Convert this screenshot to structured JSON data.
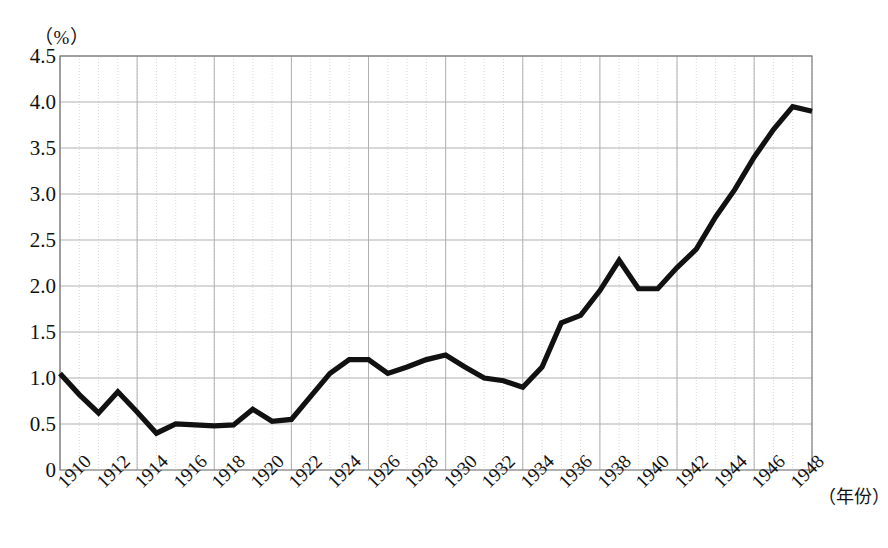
{
  "figure": {
    "y_axis_unit": "（%）",
    "x_axis_title": "（年份）",
    "caption": "",
    "line_color": "#111111",
    "grid_minor_color": "#d8d8d8",
    "grid_major_color": "#b0b0b0",
    "axis_color": "#7a7a7a"
  },
  "chart_data": {
    "type": "line",
    "title": "",
    "subtitle": "",
    "xlabel": "（年份）",
    "ylabel": "（%）",
    "xlim": [
      1910,
      1949
    ],
    "ylim": [
      0,
      4.5
    ],
    "grid": true,
    "legend": "none",
    "y_ticks": [
      "4.5",
      "4.0",
      "3.5",
      "3.0",
      "2.5",
      "2.0",
      "1.5",
      "1.0",
      "0.5",
      "0"
    ],
    "y_tick_values": [
      4.5,
      4.0,
      3.5,
      3.0,
      2.5,
      2.0,
      1.5,
      1.0,
      0.5,
      0
    ],
    "x_ticks": [
      "1910",
      "1912",
      "1914",
      "1916",
      "1918",
      "1920",
      "1922",
      "1924",
      "1926",
      "1928",
      "1930",
      "1932",
      "1934",
      "1936",
      "1938",
      "1940",
      "1942",
      "1944",
      "1946",
      "1948"
    ],
    "x_tick_values": [
      1910,
      1912,
      1914,
      1916,
      1918,
      1920,
      1922,
      1924,
      1926,
      1928,
      1930,
      1932,
      1934,
      1936,
      1938,
      1940,
      1942,
      1944,
      1946,
      1948
    ],
    "x": [
      1910,
      1911,
      1912,
      1913,
      1914,
      1915,
      1916,
      1917,
      1918,
      1919,
      1920,
      1921,
      1922,
      1923,
      1924,
      1925,
      1926,
      1927,
      1928,
      1929,
      1930,
      1931,
      1932,
      1933,
      1934,
      1935,
      1936,
      1937,
      1938,
      1939,
      1940,
      1941,
      1942,
      1943,
      1944,
      1945,
      1946,
      1947,
      1948,
      1949
    ],
    "values": [
      1.05,
      0.82,
      0.62,
      0.85,
      0.63,
      0.4,
      0.5,
      0.49,
      0.48,
      0.49,
      0.66,
      0.53,
      0.55,
      0.8,
      1.05,
      1.2,
      1.2,
      1.05,
      1.12,
      1.2,
      1.25,
      1.12,
      1.0,
      0.97,
      0.9,
      1.12,
      1.6,
      1.68,
      1.95,
      2.28,
      1.97,
      1.97,
      2.2,
      2.4,
      2.75,
      3.05,
      3.4,
      3.7,
      3.95,
      3.9
    ],
    "series": [
      {
        "name": "",
        "values": [
          1.05,
          0.82,
          0.62,
          0.85,
          0.63,
          0.4,
          0.5,
          0.49,
          0.48,
          0.49,
          0.66,
          0.53,
          0.55,
          0.8,
          1.05,
          1.2,
          1.2,
          1.05,
          1.12,
          1.2,
          1.25,
          1.12,
          1.0,
          0.97,
          0.9,
          1.12,
          1.6,
          1.68,
          1.95,
          2.28,
          1.97,
          1.97,
          2.2,
          2.4,
          2.75,
          3.05,
          3.4,
          3.7,
          3.95,
          3.9
        ]
      }
    ]
  }
}
